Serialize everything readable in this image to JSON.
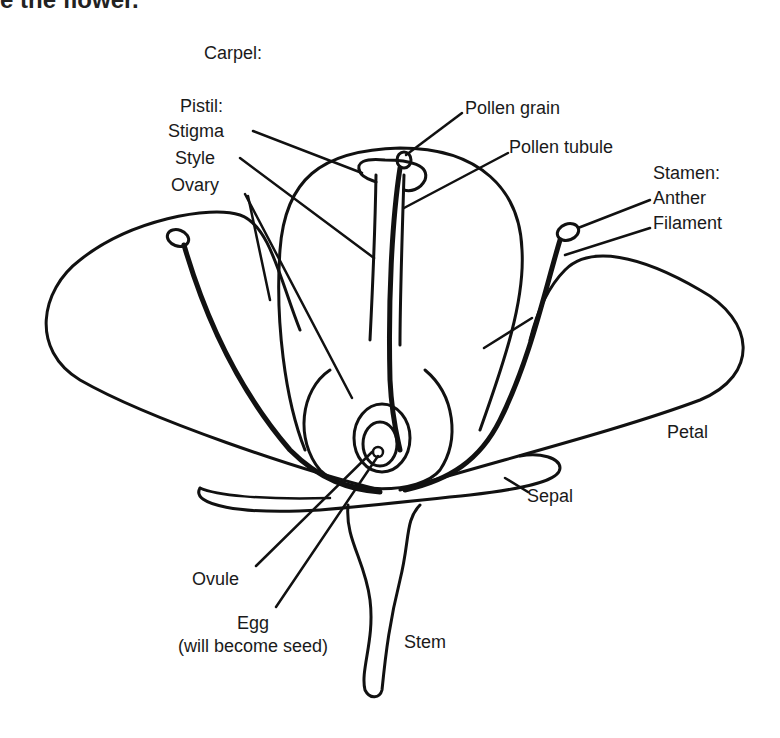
{
  "diagram": {
    "title_fragment": "e the flower.",
    "type": "labeled biological illustration: parts of a flower",
    "stroke_color": "#111111",
    "background": "#ffffff",
    "labels": {
      "carpel": "Carpel:",
      "pistil": "Pistil:",
      "stigma": "Stigma",
      "style": "Style",
      "ovary": "Ovary",
      "pollen_grain": "Pollen grain",
      "pollen_tubule": "Pollen tubule",
      "stamen": "Stamen:",
      "anther": "Anther",
      "filament": "Filament",
      "petal": "Petal",
      "sepal": "Sepal",
      "ovule": "Ovule",
      "egg": "Egg",
      "egg_note": "(will become seed)",
      "stem": "Stem"
    }
  }
}
